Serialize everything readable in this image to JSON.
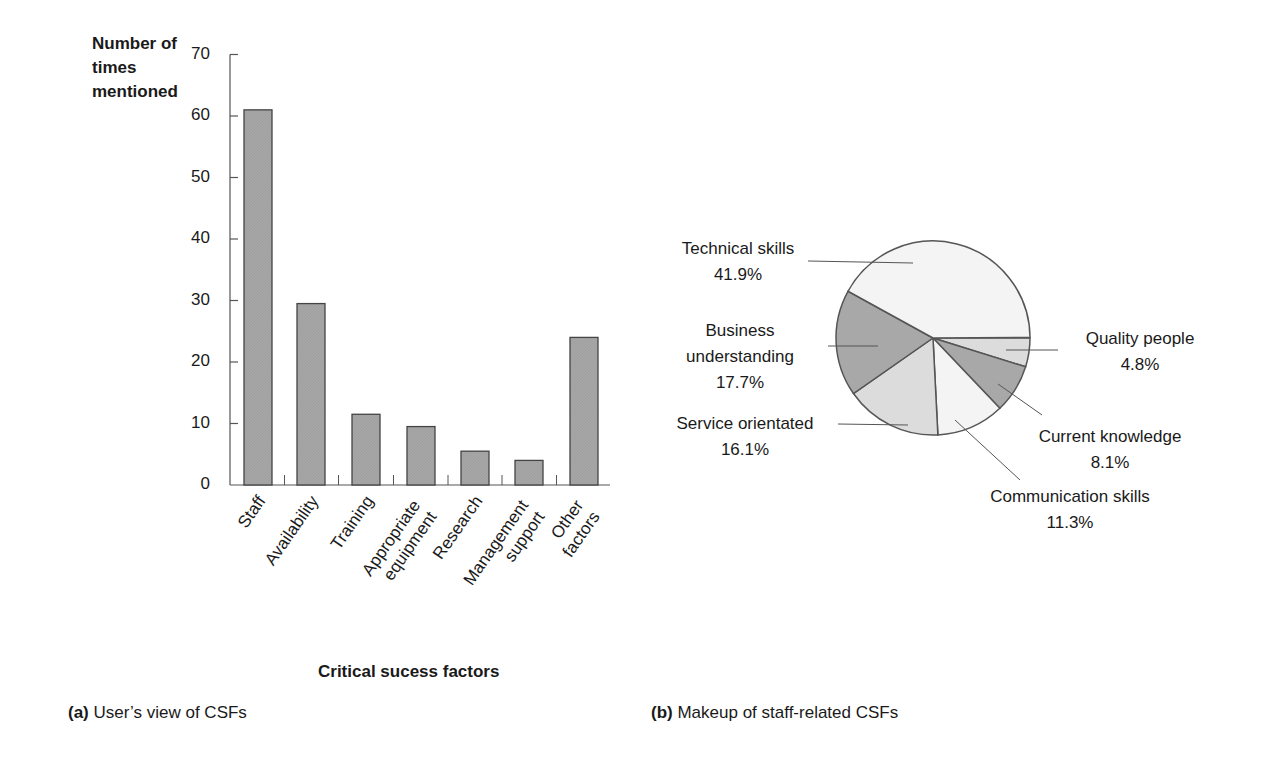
{
  "chart_data": [
    {
      "type": "bar",
      "title": "",
      "caption_prefix": "(a)",
      "caption": "User's view of CSFs",
      "xlabel": "Critical sucess factors",
      "ylabel": "Number of times mentioned",
      "ylabel_lines": [
        "Number of",
        "times",
        "mentioned"
      ],
      "ylim": [
        0,
        70
      ],
      "yticks": [
        0,
        10,
        20,
        30,
        40,
        50,
        60,
        70
      ],
      "grid": false,
      "categories": [
        "Staff",
        "Availability",
        "Training",
        "Appropriate equipment",
        "Research",
        "Management support",
        "Other factors"
      ],
      "category_lines": [
        [
          "Staff"
        ],
        [
          "Availability"
        ],
        [
          "Training"
        ],
        [
          "Appropriate",
          "equipment"
        ],
        [
          "Research"
        ],
        [
          "Management",
          "support"
        ],
        [
          "Other",
          "factors"
        ]
      ],
      "values": [
        61,
        29.5,
        11.5,
        9.5,
        5.5,
        4,
        24
      ],
      "bar_color": "#a6a6a6"
    },
    {
      "type": "pie",
      "title": "",
      "caption_prefix": "(b)",
      "caption": "Makeup of staff-related CSFs",
      "slices": [
        {
          "label": "Quality people",
          "value": 4.8,
          "display": "4.8%",
          "color": "#dcdcdc"
        },
        {
          "label": "Current knowledge",
          "value": 8.1,
          "display": "8.1%",
          "color": "#a8a8a8"
        },
        {
          "label": "Communication skills",
          "value": 11.3,
          "display": "11.3%",
          "color": "#f4f4f4"
        },
        {
          "label": "Service orientated",
          "value": 16.1,
          "display": "16.1%",
          "color": "#dcdcdc"
        },
        {
          "label": "Business understanding",
          "value": 17.7,
          "display": "17.7%",
          "color": "#a8a8a8"
        },
        {
          "label": "Technical skills",
          "value": 41.9,
          "display": "41.9%",
          "color": "#f4f4f4"
        }
      ]
    }
  ],
  "labels": {
    "bar_ylabel": [
      "Number of",
      "times",
      "mentioned"
    ],
    "bar_xtitle": "Critical sucess factors",
    "caption_a_prefix": "(a)",
    "caption_a_text": " User’s view of CSFs",
    "caption_b_prefix": "(b)",
    "caption_b_text": " Makeup of staff-related CSFs",
    "pie": {
      "technical": {
        "name": "Technical skills",
        "pct": "41.9%"
      },
      "business": {
        "name1": "Business",
        "name2": "understanding",
        "pct": "17.7%"
      },
      "service": {
        "name": "Service orientated",
        "pct": "16.1%"
      },
      "quality": {
        "name": "Quality people",
        "pct": "4.8%"
      },
      "current": {
        "name": "Current knowledge",
        "pct": "8.1%"
      },
      "communication": {
        "name": "Communication skills",
        "pct": "11.3%"
      }
    }
  }
}
